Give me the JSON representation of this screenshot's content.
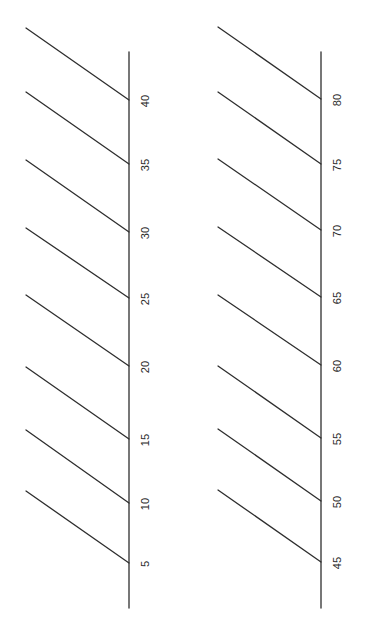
{
  "diagram": {
    "type": "slanted-number-line-worksheet",
    "line_color": "#2e2e2e",
    "label_color": "#2a2a2a",
    "background": "#ffffff",
    "columns": [
      {
        "name": "left-scale",
        "axis": {
          "x": 129,
          "y_top": 52,
          "y_bottom": 608
        },
        "diagonal_start_x": 26,
        "label_x": 146,
        "ticks": [
          {
            "label": "40",
            "y": 100,
            "start_y": 28
          },
          {
            "label": "35",
            "y": 164,
            "start_y": 92
          },
          {
            "label": "30",
            "y": 232,
            "start_y": 160
          },
          {
            "label": "25",
            "y": 298,
            "start_y": 228
          },
          {
            "label": "20",
            "y": 366,
            "start_y": 295
          },
          {
            "label": "15",
            "y": 439,
            "start_y": 367
          },
          {
            "label": "10",
            "y": 503,
            "start_y": 430
          },
          {
            "label": "5",
            "y": 563,
            "start_y": 491
          }
        ]
      },
      {
        "name": "right-scale",
        "axis": {
          "x": 321,
          "y_top": 52,
          "y_bottom": 608
        },
        "diagonal_start_x": 218,
        "label_x": 338,
        "ticks": [
          {
            "label": "80",
            "y": 99,
            "start_y": 27
          },
          {
            "label": "75",
            "y": 164,
            "start_y": 92
          },
          {
            "label": "70",
            "y": 230,
            "start_y": 159
          },
          {
            "label": "65",
            "y": 297,
            "start_y": 227
          },
          {
            "label": "60",
            "y": 365,
            "start_y": 295
          },
          {
            "label": "55",
            "y": 438,
            "start_y": 366
          },
          {
            "label": "50",
            "y": 501,
            "start_y": 429
          },
          {
            "label": "45",
            "y": 562,
            "start_y": 490
          }
        ]
      }
    ]
  }
}
